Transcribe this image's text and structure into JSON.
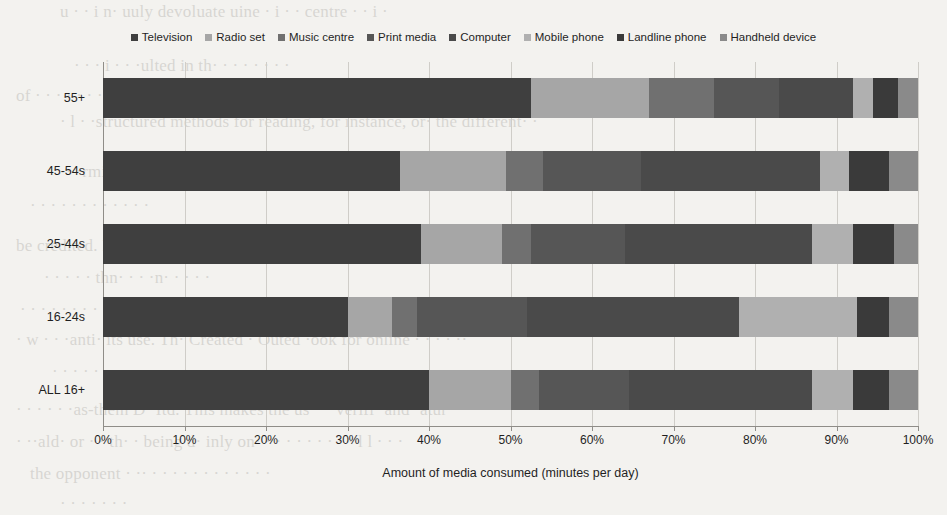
{
  "chart_data": {
    "type": "bar",
    "subtype": "stacked-horizontal-100pct",
    "title": "",
    "xlabel": "Amount of media consumed (minutes per day)",
    "ylabel": "",
    "xlim": [
      0,
      100
    ],
    "xticks": [
      0,
      10,
      20,
      30,
      40,
      50,
      60,
      70,
      80,
      90,
      100
    ],
    "xtick_labels": [
      "0%",
      "10%",
      "20%",
      "30%",
      "40%",
      "50%",
      "60%",
      "70%",
      "80%",
      "90%",
      "100%"
    ],
    "grid": true,
    "legend_position": "top",
    "categories": [
      "55+",
      "45-54s",
      "25-44s",
      "16-24s",
      "ALL 16+"
    ],
    "series": [
      {
        "name": "Television",
        "color": "#3f3f3f",
        "values": [
          52.5,
          36.5,
          39.0,
          30.0,
          40.0
        ]
      },
      {
        "name": "Radio set",
        "color": "#a6a6a6",
        "values": [
          14.5,
          13.0,
          10.0,
          5.5,
          10.0
        ]
      },
      {
        "name": "Music centre",
        "color": "#707070",
        "values": [
          8.0,
          4.5,
          3.5,
          3.0,
          3.5
        ]
      },
      {
        "name": "Print media",
        "color": "#565656",
        "values": [
          8.0,
          12.0,
          11.5,
          13.5,
          11.0
        ]
      },
      {
        "name": "Computer",
        "color": "#4a4a4a",
        "values": [
          9.0,
          22.0,
          23.0,
          26.0,
          22.5
        ]
      },
      {
        "name": "Mobile phone",
        "color": "#b0b0b0",
        "values": [
          2.5,
          3.5,
          5.0,
          14.5,
          5.0
        ]
      },
      {
        "name": "Landline phone",
        "color": "#3a3a3a",
        "values": [
          3.0,
          5.0,
          5.0,
          4.0,
          4.5
        ]
      },
      {
        "name": "Handheld device",
        "color": "#8a8a8a",
        "values": [
          2.5,
          3.5,
          3.0,
          3.5,
          3.5
        ]
      }
    ]
  },
  "legend": {
    "items": [
      {
        "label": "Television"
      },
      {
        "label": "Radio set"
      },
      {
        "label": "Music centre"
      },
      {
        "label": "Print media"
      },
      {
        "label": "Computer"
      },
      {
        "label": "Mobile phone"
      },
      {
        "label": "Landline phone"
      },
      {
        "label": "Handheld device"
      }
    ]
  },
  "page_bleed": [
    {
      "text": "u ·   · i    n· uuly devoluate uine · i ·  · centre ·  · i ·",
      "left": 60,
      "top": 2
    },
    {
      "text": "· ·  · i · · ·ulted in th· ·  · ·  ·  ·  ·   ·",
      "left": 74,
      "top": 56
    },
    {
      "text": "of · · ·  ·   ·   ·   ·  ·   ·   ·  ·",
      "left": 16,
      "top": 86
    },
    {
      "text": "· l · ·structured methods for reading, for instance, or· the different· ·",
      "left": 60,
      "top": 112
    },
    {
      "text": "· ·rmine of tools like Quickchat · · · tutting, here has proven they· that",
      "left": 66,
      "top": 162
    },
    {
      "text": "· · ·  · · ·   ·  ·  ·   · ·   ·",
      "left": 30,
      "top": 196
    },
    {
      "text": "be credited. Fraud · · l · ·    · · · ·  ·   ·",
      "left": 16,
      "top": 236
    },
    {
      "text": "·  ·  · · · thn· · · ·n· · ·  · ·",
      "left": 44,
      "top": 268
    },
    {
      "text": "· ·  ·   ·   ·  ·   ·  · ·   ·",
      "left": 20,
      "top": 300
    },
    {
      "text": "· w · · ·anti· its use. Th· Created · Outed ·ook for online · · · · ··",
      "left": 16,
      "top": 330
    },
    {
      "text": "· · · · · · ·  · · · ·  ·  · ·",
      "left": 52,
      "top": 362
    },
    {
      "text": "· · ·  · · ·as-them D· Itd. This makes the us· · ·verifi· and ·atur·",
      "left": 16,
      "top": 400
    },
    {
      "text": "· ··ald· or · · th· · being d· inly on· · ·  · · · · · · · l l · · ·",
      "left": 16,
      "top": 432
    },
    {
      "text": "the opponent · ·· · ·  ·  ·  · · · ·  · · · ·",
      "left": 30,
      "top": 464
    },
    {
      "text": "·  · ·   ·  ·   ·  ·",
      "left": 60,
      "top": 494
    }
  ]
}
